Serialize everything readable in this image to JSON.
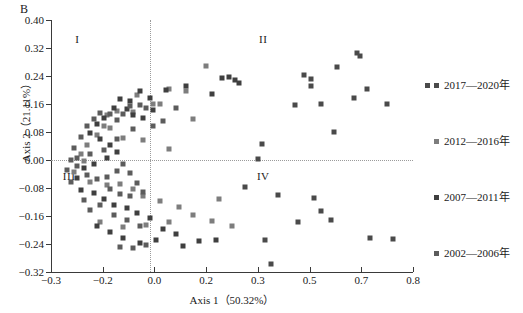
{
  "panel": {
    "letter": "B"
  },
  "axes": {
    "x": {
      "title": "Axis 1（50.32%）",
      "ticks": [
        "-0.3",
        "-0.2",
        "0.0",
        "0.2",
        "0.3",
        "0.5",
        "0.7",
        "0.8"
      ],
      "tick_values": [
        -0.3,
        -0.2,
        0.0,
        0.2,
        0.3,
        0.5,
        0.7,
        0.8
      ],
      "min": -0.3,
      "max": 0.8
    },
    "y": {
      "title": "Axis 2（21.11%）",
      "ticks": [
        "0.40",
        "0.32",
        "0.24",
        "0.16",
        "0.08",
        "0.00",
        "-0.08",
        "-0.16",
        "-0.24",
        "-0.32"
      ],
      "tick_values": [
        0.4,
        0.32,
        0.24,
        0.16,
        0.08,
        0.0,
        -0.08,
        -0.16,
        -0.24,
        -0.32
      ],
      "min": -0.32,
      "max": 0.4
    }
  },
  "quadrants": [
    {
      "label": "I",
      "x": -0.22,
      "y": 0.345
    },
    {
      "label": "II",
      "x": 0.345,
      "y": 0.345
    },
    {
      "label": "III",
      "x": -0.245,
      "y": -0.045
    },
    {
      "label": "IV",
      "x": 0.345,
      "y": -0.045
    }
  ],
  "reference_lines": {
    "vertical_x": 0.0,
    "horizontal_y": 0.0,
    "style": "dotted",
    "color": "#9b9b9b"
  },
  "legend": {
    "position": "right",
    "items": [
      {
        "label": "2017—2020年",
        "color": "#4a4a4a",
        "top": 16,
        "double_marker": true
      },
      {
        "label": "2012—2016年",
        "color": "#7d7d7d",
        "top": 72,
        "double_marker": false
      },
      {
        "label": "2007—2011年",
        "color": "#3f3f3f",
        "top": 128,
        "double_marker": false
      },
      {
        "label": "2002—2006年",
        "color": "#5c5c5c",
        "top": 184,
        "double_marker": false
      }
    ]
  },
  "chart_data": {
    "type": "scatter",
    "title": "B",
    "xlabel": "Axis 1（50.32%）",
    "ylabel": "Axis 2（21.11%）",
    "xlim": [
      -0.3,
      0.8
    ],
    "ylim": [
      -0.32,
      0.4
    ],
    "grid": false,
    "legend_position": "right",
    "marker": "square",
    "series": [
      {
        "name": "2017—2020年",
        "color": "#4a4a4a",
        "points": [
          [
            0.63,
            0.305
          ],
          [
            0.64,
            0.298
          ],
          [
            0.57,
            0.265
          ],
          [
            0.66,
            0.203
          ],
          [
            0.47,
            0.243
          ],
          [
            0.49,
            0.231
          ],
          [
            0.49,
            0.211
          ],
          [
            0.62,
            0.178
          ],
          [
            0.52,
            0.159
          ],
          [
            0.72,
            0.159
          ],
          [
            0.44,
            0.158
          ],
          [
            0.56,
            0.081
          ],
          [
            0.34,
            0.045
          ],
          [
            0.33,
            0.002
          ],
          [
            0.29,
            -0.076
          ],
          [
            0.39,
            -0.101
          ],
          [
            0.5,
            -0.108
          ],
          [
            0.52,
            -0.146
          ],
          [
            0.55,
            -0.172
          ],
          [
            0.45,
            -0.176
          ],
          [
            0.67,
            -0.222
          ],
          [
            0.74,
            -0.226
          ],
          [
            0.37,
            -0.298
          ],
          [
            0.35,
            -0.229
          ]
        ]
      },
      {
        "name": "2012—2016年",
        "color": "#7d7d7d",
        "points": [
          [
            0.17,
            0.268
          ],
          [
            0.06,
            0.204
          ],
          [
            0.11,
            0.196
          ],
          [
            0.03,
            0.16
          ],
          [
            0.01,
            0.16
          ],
          [
            0.13,
            0.117
          ],
          [
            -0.04,
            0.185
          ],
          [
            -0.05,
            0.137
          ],
          [
            -0.1,
            0.141
          ],
          [
            -0.13,
            0.128
          ],
          [
            -0.14,
            0.098
          ],
          [
            -0.12,
            0.091
          ],
          [
            -0.16,
            0.072
          ],
          [
            -0.08,
            0.062
          ],
          [
            -0.02,
            0.058
          ],
          [
            0.06,
            0.032
          ],
          [
            -0.19,
            0.043
          ],
          [
            -0.21,
            0.018
          ],
          [
            -0.2,
            -0.004
          ],
          [
            -0.23,
            -0.035
          ],
          [
            -0.18,
            -0.062
          ],
          [
            -0.13,
            -0.072
          ],
          [
            -0.09,
            -0.068
          ],
          [
            -0.05,
            -0.082
          ],
          [
            -0.02,
            -0.104
          ],
          [
            0.03,
            -0.118
          ],
          [
            0.09,
            -0.134
          ],
          [
            0.13,
            -0.158
          ],
          [
            0.06,
            -0.176
          ],
          [
            -0.01,
            -0.186
          ],
          [
            -0.08,
            -0.192
          ],
          [
            -0.15,
            -0.178
          ],
          [
            0.21,
            -0.112
          ],
          [
            0.19,
            -0.175
          ],
          [
            0.25,
            -0.188
          ]
        ]
      },
      {
        "name": "2007—2011年",
        "color": "#3f3f3f",
        "points": [
          [
            0.24,
            0.236
          ],
          [
            0.26,
            0.228
          ],
          [
            0.27,
            0.219
          ],
          [
            0.22,
            0.233
          ],
          [
            0.19,
            0.19
          ],
          [
            0.11,
            0.212
          ],
          [
            0.05,
            0.199
          ],
          [
            0.0,
            0.178
          ],
          [
            -0.03,
            0.196
          ],
          [
            -0.06,
            0.168
          ],
          [
            -0.09,
            0.173
          ],
          [
            -0.11,
            0.15
          ],
          [
            -0.07,
            0.145
          ],
          [
            -0.05,
            0.128
          ],
          [
            -0.02,
            0.12
          ],
          [
            0.01,
            0.142
          ],
          [
            -0.14,
            0.119
          ],
          [
            -0.16,
            0.104
          ],
          [
            -0.18,
            0.077
          ],
          [
            -0.15,
            0.06
          ],
          [
            -0.12,
            0.043
          ],
          [
            -0.1,
            0.022
          ],
          [
            -0.13,
            0.006
          ],
          [
            -0.17,
            -0.012
          ],
          [
            -0.2,
            -0.024
          ],
          [
            -0.22,
            -0.05
          ],
          [
            -0.21,
            -0.086
          ],
          [
            -0.17,
            -0.093
          ],
          [
            -0.14,
            -0.112
          ],
          [
            -0.11,
            -0.128
          ],
          [
            -0.07,
            -0.137
          ],
          [
            -0.04,
            -0.152
          ],
          [
            0.0,
            -0.166
          ],
          [
            0.04,
            -0.196
          ],
          [
            0.08,
            -0.212
          ],
          [
            0.02,
            -0.228
          ],
          [
            -0.03,
            -0.236
          ],
          [
            -0.08,
            -0.224
          ],
          [
            -0.12,
            -0.206
          ],
          [
            -0.16,
            -0.188
          ],
          [
            0.15,
            -0.232
          ],
          [
            0.2,
            -0.229
          ],
          [
            0.1,
            -0.246
          ]
        ]
      },
      {
        "name": "2002—2006年",
        "color": "#5c5c5c",
        "points": [
          [
            -0.01,
            0.15
          ],
          [
            -0.03,
            0.158
          ],
          [
            -0.06,
            0.155
          ],
          [
            -0.08,
            0.131
          ],
          [
            -0.1,
            0.113
          ],
          [
            -0.12,
            0.131
          ],
          [
            -0.15,
            0.134
          ],
          [
            -0.17,
            0.118
          ],
          [
            -0.19,
            0.097
          ],
          [
            -0.21,
            0.065
          ],
          [
            -0.23,
            0.034
          ],
          [
            -0.24,
            0.001
          ],
          [
            -0.22,
            -0.016
          ],
          [
            -0.19,
            -0.042
          ],
          [
            -0.16,
            -0.055
          ],
          [
            -0.13,
            -0.048
          ],
          [
            -0.1,
            -0.03
          ],
          [
            -0.08,
            -0.012
          ],
          [
            -0.06,
            -0.038
          ],
          [
            -0.04,
            -0.066
          ],
          [
            -0.02,
            -0.09
          ],
          [
            -0.06,
            -0.104
          ],
          [
            -0.09,
            -0.098
          ],
          [
            -0.12,
            -0.082
          ],
          [
            -0.15,
            -0.128
          ],
          [
            -0.18,
            -0.142
          ],
          [
            -0.11,
            -0.158
          ],
          [
            -0.07,
            -0.172
          ],
          [
            -0.03,
            -0.188
          ],
          [
            -0.2,
            -0.114
          ],
          [
            -0.24,
            -0.064
          ],
          [
            -0.25,
            -0.028
          ],
          [
            -0.22,
            0.006
          ],
          [
            -0.18,
            0.018
          ],
          [
            -0.14,
            0.03
          ],
          [
            -0.1,
            0.06
          ],
          [
            -0.05,
            0.088
          ],
          [
            0.01,
            0.098
          ],
          [
            0.04,
            0.112
          ],
          [
            0.08,
            0.148
          ],
          [
            -0.09,
            -0.248
          ],
          [
            -0.05,
            -0.252
          ],
          [
            -0.01,
            -0.242
          ]
        ]
      }
    ]
  }
}
